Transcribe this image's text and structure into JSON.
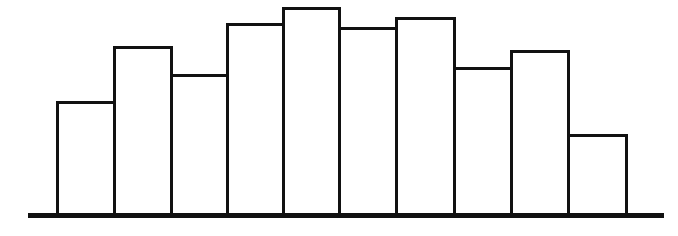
{
  "chart_data": {
    "type": "bar",
    "title": "",
    "xlabel": "",
    "ylabel": "",
    "categories": [
      "1",
      "2",
      "3",
      "4",
      "5",
      "6",
      "7",
      "8",
      "9",
      "10"
    ],
    "values": [
      114,
      169,
      141,
      192,
      208,
      188,
      198,
      148,
      165,
      81
    ],
    "ylim": [
      0,
      215
    ],
    "grid": false,
    "legend": null,
    "bar_style": {
      "fill": "#ffffff",
      "stroke": "#111111",
      "adjacent": true
    },
    "layout": {
      "baseline_y": 215,
      "baseline_x0": 28,
      "baseline_x1": 664,
      "bar_edges_x": [
        57,
        114,
        171,
        227,
        283,
        339,
        396,
        454,
        511,
        568,
        626
      ]
    }
  }
}
